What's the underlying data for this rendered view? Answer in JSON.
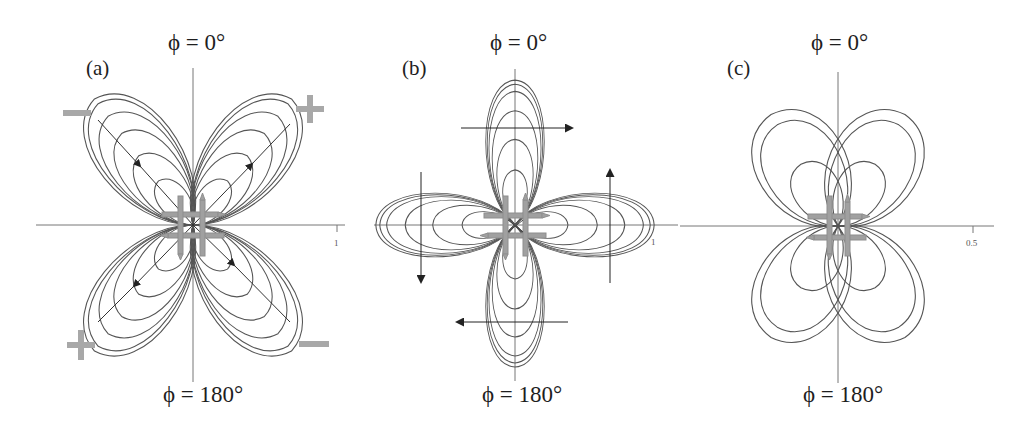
{
  "figure": {
    "panels": [
      {
        "id": "a",
        "label": "(a)",
        "top_angle": "ϕ = 0°",
        "bottom_angle": "ϕ = 180°",
        "axis_tick_label": "1",
        "sign_markers": {
          "top_left": "minus",
          "top_right": "plus",
          "bottom_left": "plus",
          "bottom_right": "minus"
        },
        "lobe_pattern": "four diagonal lobes (quadrupolar, 45°/135°/225°/315°), 6 nested contours each",
        "arrows": "along diagonals: inward on upper-left and lower-right lobes, outward on upper-right and lower-left lobes"
      },
      {
        "id": "b",
        "label": "(b)",
        "top_angle": "ϕ = 0°",
        "bottom_angle": "ϕ = 180°",
        "axis_tick_label": "1",
        "lobe_pattern": "four axial lobes (0°/90°/180°/270°), 6 nested contours each",
        "arrows": "circulating: rightward across top lobe, upward through right lobe, leftward across bottom lobe, downward through left lobe"
      },
      {
        "id": "c",
        "label": "(c)",
        "top_angle": "ϕ = 0°",
        "bottom_angle": "ϕ = 180°",
        "axis_tick_label": "0.5",
        "lobe_pattern": "four diagonal lobes, 3 nested contours each, lobes tilted toward vertical axis",
        "arrows": "none"
      }
    ],
    "colors": {
      "line": "#555555",
      "axis": "#777777",
      "schematic_arrow": "#9a9a9a",
      "sign": "#a8a8a8",
      "background": "#ffffff"
    }
  }
}
